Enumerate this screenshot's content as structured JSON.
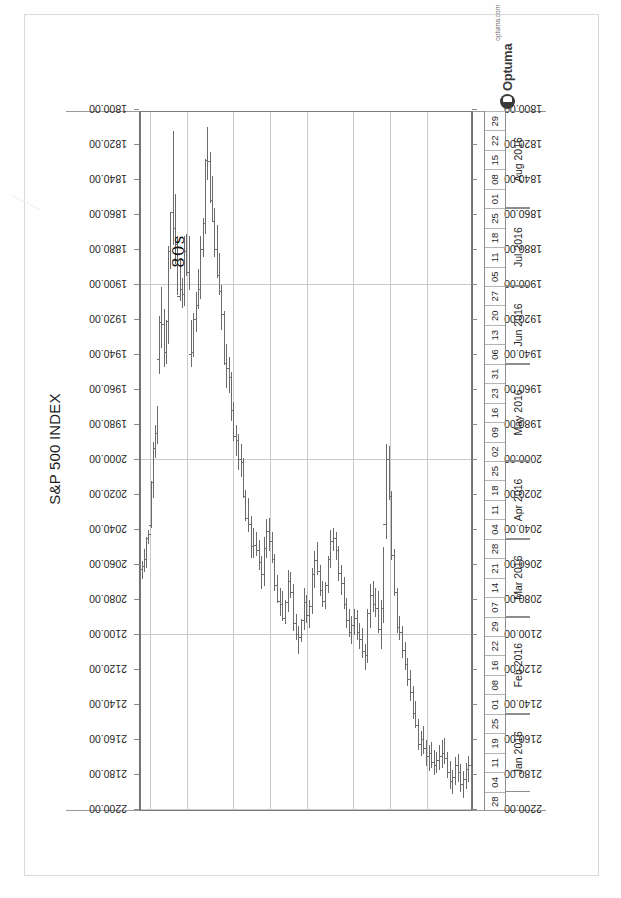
{
  "chart_data": {
    "type": "ohlc",
    "title": "S&P 500 INDEX",
    "xlabel": "",
    "ylabel": "",
    "ylim": [
      1800.0,
      2200.0
    ],
    "ytick_step": 20,
    "grid": true,
    "legend": "none",
    "orientation": "page-rotated-90",
    "yticks": [
      "2200.00",
      "2180.00",
      "2160.00",
      "2140.00",
      "2120.00",
      "2100.00",
      "2080.00",
      "2060.00",
      "2040.00",
      "2020.00",
      "2000.00",
      "1980.00",
      "1960.00",
      "1940.00",
      "1920.00",
      "1900.00",
      "1880.00",
      "1860.00",
      "1840.00",
      "1820.00",
      "1800.00"
    ],
    "x_day_ticks": [
      "28",
      "04",
      "11",
      "19",
      "25",
      "01",
      "08",
      "16",
      "22",
      "29",
      "07",
      "14",
      "21",
      "28",
      "04",
      "11",
      "18",
      "25",
      "02",
      "09",
      "16",
      "23",
      "31",
      "06",
      "13",
      "20",
      "27",
      "05",
      "11",
      "18",
      "25",
      "01",
      "08",
      "15",
      "22",
      "29"
    ],
    "x_month_groups": [
      {
        "label": "Jan 2016",
        "start_index": 1,
        "span": 4
      },
      {
        "label": "Feb 2016",
        "start_index": 5,
        "span": 5
      },
      {
        "label": "Mar 2016",
        "start_index": 10,
        "span": 4
      },
      {
        "label": "Apr 2016",
        "start_index": 14,
        "span": 4
      },
      {
        "label": "May 2016",
        "start_index": 18,
        "span": 5
      },
      {
        "label": "Jun 2016",
        "start_index": 23,
        "span": 4
      },
      {
        "label": "Jul 2016",
        "start_index": 27,
        "span": 4
      },
      {
        "label": "Aug 2016",
        "start_index": 31,
        "span": 5
      }
    ],
    "bars": [
      {
        "x": 0.004,
        "o": 2063,
        "h": 2068,
        "l": 2058,
        "c": 2061
      },
      {
        "x": 0.01,
        "o": 2061,
        "h": 2064,
        "l": 2051,
        "c": 2057
      },
      {
        "x": 0.016,
        "o": 2057,
        "h": 2062,
        "l": 2044,
        "c": 2045
      },
      {
        "x": 0.022,
        "o": 2045,
        "h": 2048,
        "l": 2040,
        "c": 2043
      },
      {
        "x": 0.03,
        "o": 2038,
        "h": 2039,
        "l": 2012,
        "c": 2013
      },
      {
        "x": 0.036,
        "o": 2013,
        "h": 2022,
        "l": 1990,
        "c": 1994
      },
      {
        "x": 0.042,
        "o": 1994,
        "h": 1999,
        "l": 1980,
        "c": 1985
      },
      {
        "x": 0.048,
        "o": 1985,
        "h": 1991,
        "l": 1969,
        "c": 1943
      },
      {
        "x": 0.055,
        "o": 1943,
        "h": 1951,
        "l": 1918,
        "c": 1922
      },
      {
        "x": 0.061,
        "o": 1922,
        "h": 1936,
        "l": 1901,
        "c": 1923
      },
      {
        "x": 0.068,
        "o": 1923,
        "h": 1947,
        "l": 1914,
        "c": 1939
      },
      {
        "x": 0.074,
        "o": 1939,
        "h": 1945,
        "l": 1920,
        "c": 1921
      },
      {
        "x": 0.081,
        "o": 1921,
        "h": 1934,
        "l": 1878,
        "c": 1881
      },
      {
        "x": 0.088,
        "o": 1881,
        "h": 1891,
        "l": 1859,
        "c": 1859
      },
      {
        "x": 0.095,
        "o": 1859,
        "h": 1877,
        "l": 1812,
        "c": 1868
      },
      {
        "x": 0.102,
        "o": 1868,
        "h": 1888,
        "l": 1848,
        "c": 1877
      },
      {
        "x": 0.109,
        "o": 1877,
        "h": 1906,
        "l": 1872,
        "c": 1907
      },
      {
        "x": 0.116,
        "o": 1907,
        "h": 1909,
        "l": 1886,
        "c": 1903
      },
      {
        "x": 0.123,
        "o": 1903,
        "h": 1913,
        "l": 1896,
        "c": 1906
      },
      {
        "x": 0.13,
        "o": 1906,
        "h": 1912,
        "l": 1872,
        "c": 1881
      },
      {
        "x": 0.137,
        "o": 1881,
        "h": 1895,
        "l": 1871,
        "c": 1893
      },
      {
        "x": 0.144,
        "o": 1893,
        "h": 1903,
        "l": 1872,
        "c": 1940
      },
      {
        "x": 0.151,
        "o": 1940,
        "h": 1947,
        "l": 1920,
        "c": 1939
      },
      {
        "x": 0.158,
        "o": 1939,
        "h": 1941,
        "l": 1916,
        "c": 1920
      },
      {
        "x": 0.165,
        "o": 1920,
        "h": 1927,
        "l": 1904,
        "c": 1912
      },
      {
        "x": 0.172,
        "o": 1912,
        "h": 1914,
        "l": 1891,
        "c": 1903
      },
      {
        "x": 0.179,
        "o": 1903,
        "h": 1908,
        "l": 1872,
        "c": 1880
      },
      {
        "x": 0.186,
        "o": 1880,
        "h": 1884,
        "l": 1862,
        "c": 1865
      },
      {
        "x": 0.193,
        "o": 1865,
        "h": 1871,
        "l": 1828,
        "c": 1829
      },
      {
        "x": 0.2,
        "o": 1829,
        "h": 1840,
        "l": 1810,
        "c": 1830
      },
      {
        "x": 0.207,
        "o": 1830,
        "h": 1853,
        "l": 1824,
        "c": 1852
      },
      {
        "x": 0.214,
        "o": 1852,
        "h": 1864,
        "l": 1838,
        "c": 1864
      },
      {
        "x": 0.221,
        "o": 1864,
        "h": 1884,
        "l": 1856,
        "c": 1880
      },
      {
        "x": 0.228,
        "o": 1880,
        "h": 1896,
        "l": 1866,
        "c": 1895
      },
      {
        "x": 0.235,
        "o": 1895,
        "h": 1906,
        "l": 1882,
        "c": 1904
      },
      {
        "x": 0.242,
        "o": 1904,
        "h": 1926,
        "l": 1900,
        "c": 1917
      },
      {
        "x": 0.249,
        "o": 1917,
        "h": 1946,
        "l": 1915,
        "c": 1945
      },
      {
        "x": 0.257,
        "o": 1945,
        "h": 1959,
        "l": 1934,
        "c": 1948
      },
      {
        "x": 0.264,
        "o": 1948,
        "h": 1962,
        "l": 1941,
        "c": 1953
      },
      {
        "x": 0.271,
        "o": 1953,
        "h": 1978,
        "l": 1950,
        "c": 1972
      },
      {
        "x": 0.278,
        "o": 1972,
        "h": 1989,
        "l": 1967,
        "c": 1987
      },
      {
        "x": 0.286,
        "o": 1987,
        "h": 1998,
        "l": 1980,
        "c": 1989
      },
      {
        "x": 0.293,
        "o": 1989,
        "h": 2006,
        "l": 1985,
        "c": 2000
      },
      {
        "x": 0.3,
        "o": 2000,
        "h": 2010,
        "l": 1991,
        "c": 2002
      },
      {
        "x": 0.307,
        "o": 2002,
        "h": 2022,
        "l": 1999,
        "c": 2021
      },
      {
        "x": 0.314,
        "o": 2021,
        "h": 2035,
        "l": 2017,
        "c": 2034
      },
      {
        "x": 0.322,
        "o": 2034,
        "h": 2041,
        "l": 2022,
        "c": 2037
      },
      {
        "x": 0.33,
        "o": 2037,
        "h": 2056,
        "l": 2032,
        "c": 2050
      },
      {
        "x": 0.338,
        "o": 2050,
        "h": 2056,
        "l": 2039,
        "c": 2049
      },
      {
        "x": 0.346,
        "o": 2049,
        "h": 2055,
        "l": 2041,
        "c": 2052
      },
      {
        "x": 0.354,
        "o": 2052,
        "h": 2063,
        "l": 2046,
        "c": 2059
      },
      {
        "x": 0.362,
        "o": 2059,
        "h": 2074,
        "l": 2055,
        "c": 2066
      },
      {
        "x": 0.37,
        "o": 2066,
        "h": 2072,
        "l": 2044,
        "c": 2051
      },
      {
        "x": 0.378,
        "o": 2051,
        "h": 2056,
        "l": 2034,
        "c": 2041
      },
      {
        "x": 0.386,
        "o": 2041,
        "h": 2052,
        "l": 2033,
        "c": 2047
      },
      {
        "x": 0.394,
        "o": 2047,
        "h": 2059,
        "l": 2041,
        "c": 2057
      },
      {
        "x": 0.402,
        "o": 2057,
        "h": 2075,
        "l": 2054,
        "c": 2072
      },
      {
        "x": 0.41,
        "o": 2072,
        "h": 2082,
        "l": 2066,
        "c": 2081
      },
      {
        "x": 0.418,
        "o": 2081,
        "h": 2089,
        "l": 2073,
        "c": 2083
      },
      {
        "x": 0.426,
        "o": 2083,
        "h": 2092,
        "l": 2075,
        "c": 2091
      },
      {
        "x": 0.434,
        "o": 2091,
        "h": 2094,
        "l": 2080,
        "c": 2082
      },
      {
        "x": 0.442,
        "o": 2082,
        "h": 2087,
        "l": 2063,
        "c": 2070
      },
      {
        "x": 0.45,
        "o": 2070,
        "h": 2079,
        "l": 2064,
        "c": 2076
      },
      {
        "x": 0.458,
        "o": 2076,
        "h": 2098,
        "l": 2071,
        "c": 2094
      },
      {
        "x": 0.466,
        "o": 2094,
        "h": 2103,
        "l": 2088,
        "c": 2100
      },
      {
        "x": 0.474,
        "o": 2100,
        "h": 2111,
        "l": 2095,
        "c": 2102
      },
      {
        "x": 0.482,
        "o": 2102,
        "h": 2104,
        "l": 2091,
        "c": 2092
      },
      {
        "x": 0.49,
        "o": 2092,
        "h": 2097,
        "l": 2073,
        "c": 2082
      },
      {
        "x": 0.498,
        "o": 2082,
        "h": 2093,
        "l": 2077,
        "c": 2089
      },
      {
        "x": 0.506,
        "o": 2089,
        "h": 2096,
        "l": 2080,
        "c": 2084
      },
      {
        "x": 0.514,
        "o": 2084,
        "h": 2088,
        "l": 2062,
        "c": 2066
      },
      {
        "x": 0.522,
        "o": 2066,
        "h": 2073,
        "l": 2052,
        "c": 2058
      },
      {
        "x": 0.53,
        "o": 2058,
        "h": 2066,
        "l": 2047,
        "c": 2064
      },
      {
        "x": 0.538,
        "o": 2064,
        "h": 2078,
        "l": 2060,
        "c": 2075
      },
      {
        "x": 0.546,
        "o": 2075,
        "h": 2084,
        "l": 2069,
        "c": 2081
      },
      {
        "x": 0.554,
        "o": 2081,
        "h": 2085,
        "l": 2070,
        "c": 2072
      },
      {
        "x": 0.562,
        "o": 2072,
        "h": 2076,
        "l": 2055,
        "c": 2057
      },
      {
        "x": 0.57,
        "o": 2057,
        "h": 2062,
        "l": 2040,
        "c": 2047
      },
      {
        "x": 0.578,
        "o": 2047,
        "h": 2052,
        "l": 2039,
        "c": 2045
      },
      {
        "x": 0.586,
        "o": 2045,
        "h": 2057,
        "l": 2041,
        "c": 2052
      },
      {
        "x": 0.594,
        "o": 2052,
        "h": 2069,
        "l": 2049,
        "c": 2065
      },
      {
        "x": 0.602,
        "o": 2065,
        "h": 2077,
        "l": 2060,
        "c": 2071
      },
      {
        "x": 0.61,
        "o": 2071,
        "h": 2085,
        "l": 2067,
        "c": 2083
      },
      {
        "x": 0.618,
        "o": 2083,
        "h": 2096,
        "l": 2079,
        "c": 2092
      },
      {
        "x": 0.626,
        "o": 2092,
        "h": 2101,
        "l": 2085,
        "c": 2099
      },
      {
        "x": 0.634,
        "o": 2099,
        "h": 2105,
        "l": 2089,
        "c": 2095
      },
      {
        "x": 0.642,
        "o": 2095,
        "h": 2100,
        "l": 2085,
        "c": 2091
      },
      {
        "x": 0.65,
        "o": 2091,
        "h": 2103,
        "l": 2086,
        "c": 2099
      },
      {
        "x": 0.658,
        "o": 2099,
        "h": 2108,
        "l": 2093,
        "c": 2103
      },
      {
        "x": 0.666,
        "o": 2103,
        "h": 2113,
        "l": 2096,
        "c": 2110
      },
      {
        "x": 0.674,
        "o": 2110,
        "h": 2120,
        "l": 2105,
        "c": 2112
      },
      {
        "x": 0.682,
        "o": 2112,
        "h": 2116,
        "l": 2085,
        "c": 2088
      },
      {
        "x": 0.69,
        "o": 2088,
        "h": 2096,
        "l": 2071,
        "c": 2078
      },
      {
        "x": 0.698,
        "o": 2078,
        "h": 2087,
        "l": 2069,
        "c": 2083
      },
      {
        "x": 0.706,
        "o": 2083,
        "h": 2090,
        "l": 2073,
        "c": 2085
      },
      {
        "x": 0.714,
        "o": 2085,
        "h": 2099,
        "l": 2075,
        "c": 2097
      },
      {
        "x": 0.722,
        "o": 2097,
        "h": 2108,
        "l": 2080,
        "c": 2085
      },
      {
        "x": 0.73,
        "o": 2085,
        "h": 2093,
        "l": 2050,
        "c": 2037
      },
      {
        "x": 0.738,
        "o": 2037,
        "h": 2045,
        "l": 1991,
        "c": 2000
      },
      {
        "x": 0.746,
        "o": 2000,
        "h": 2023,
        "l": 1992,
        "c": 2021
      },
      {
        "x": 0.754,
        "o": 2021,
        "h": 2057,
        "l": 2018,
        "c": 2055
      },
      {
        "x": 0.762,
        "o": 2055,
        "h": 2078,
        "l": 2051,
        "c": 2076
      },
      {
        "x": 0.77,
        "o": 2076,
        "h": 2099,
        "l": 2073,
        "c": 2096
      },
      {
        "x": 0.778,
        "o": 2096,
        "h": 2103,
        "l": 2089,
        "c": 2099
      },
      {
        "x": 0.786,
        "o": 2099,
        "h": 2113,
        "l": 2095,
        "c": 2109
      },
      {
        "x": 0.794,
        "o": 2109,
        "h": 2120,
        "l": 2104,
        "c": 2117
      },
      {
        "x": 0.802,
        "o": 2117,
        "h": 2129,
        "l": 2113,
        "c": 2126
      },
      {
        "x": 0.81,
        "o": 2126,
        "h": 2138,
        "l": 2120,
        "c": 2133
      },
      {
        "x": 0.818,
        "o": 2133,
        "h": 2148,
        "l": 2129,
        "c": 2145
      },
      {
        "x": 0.826,
        "o": 2145,
        "h": 2153,
        "l": 2138,
        "c": 2152
      },
      {
        "x": 0.834,
        "o": 2152,
        "h": 2166,
        "l": 2148,
        "c": 2163
      },
      {
        "x": 0.842,
        "o": 2163,
        "h": 2169,
        "l": 2155,
        "c": 2160
      },
      {
        "x": 0.85,
        "o": 2160,
        "h": 2168,
        "l": 2152,
        "c": 2165
      },
      {
        "x": 0.858,
        "o": 2165,
        "h": 2175,
        "l": 2160,
        "c": 2170
      },
      {
        "x": 0.866,
        "o": 2170,
        "h": 2178,
        "l": 2163,
        "c": 2168
      },
      {
        "x": 0.874,
        "o": 2168,
        "h": 2176,
        "l": 2161,
        "c": 2173
      },
      {
        "x": 0.882,
        "o": 2173,
        "h": 2180,
        "l": 2166,
        "c": 2175
      },
      {
        "x": 0.89,
        "o": 2175,
        "h": 2179,
        "l": 2167,
        "c": 2172
      },
      {
        "x": 0.898,
        "o": 2172,
        "h": 2177,
        "l": 2163,
        "c": 2170
      },
      {
        "x": 0.906,
        "o": 2170,
        "h": 2176,
        "l": 2160,
        "c": 2168
      },
      {
        "x": 0.914,
        "o": 2168,
        "h": 2174,
        "l": 2159,
        "c": 2171
      },
      {
        "x": 0.922,
        "o": 2171,
        "h": 2182,
        "l": 2167,
        "c": 2179
      },
      {
        "x": 0.93,
        "o": 2179,
        "h": 2188,
        "l": 2172,
        "c": 2184
      },
      {
        "x": 0.938,
        "o": 2184,
        "h": 2191,
        "l": 2177,
        "c": 2182
      },
      {
        "x": 0.946,
        "o": 2182,
        "h": 2186,
        "l": 2170,
        "c": 2175
      },
      {
        "x": 0.954,
        "o": 2175,
        "h": 2184,
        "l": 2168,
        "c": 2179
      },
      {
        "x": 0.962,
        "o": 2179,
        "h": 2190,
        "l": 2174,
        "c": 2186
      },
      {
        "x": 0.97,
        "o": 2186,
        "h": 2193,
        "l": 2178,
        "c": 2183
      },
      {
        "x": 0.978,
        "o": 2183,
        "h": 2188,
        "l": 2173,
        "c": 2177
      },
      {
        "x": 0.986,
        "o": 2177,
        "h": 2184,
        "l": 2169,
        "c": 2175
      }
    ]
  },
  "annotation": {
    "handwritten_note": "80s"
  },
  "branding": {
    "wordmark": "Optuma",
    "site": "optuma.com"
  }
}
